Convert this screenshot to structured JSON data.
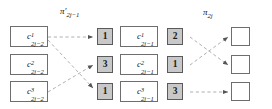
{
  "figure": {
    "title_labels": {
      "left_permutation": "π′",
      "left_permutation_sub": "2j−1",
      "right_permutation": "π",
      "right_permutation_sub": "2j"
    },
    "columns": {
      "col1_label": "input-cells",
      "col2_label": "first-counter-values",
      "col3_label": "intermediate-cells",
      "col4_label": "second-counter-values",
      "col5_label": "output-cells"
    },
    "col1_cells": [
      {
        "base": "c",
        "sup": "1",
        "sub": "2j−2"
      },
      {
        "base": "c",
        "sup": "2",
        "sub": "2j−2"
      },
      {
        "base": "c",
        "sup": "3",
        "sub": "2j−2"
      }
    ],
    "col2_numbers": [
      "1",
      "3",
      "1"
    ],
    "col3_cells": [
      {
        "base": "c",
        "sup": "1",
        "sub": "2j−1"
      },
      {
        "base": "c",
        "sup": "2",
        "sub": "2j−1"
      },
      {
        "base": "c",
        "sup": "3",
        "sub": "2j−1"
      }
    ],
    "col4_numbers": [
      "2",
      "1",
      "3"
    ],
    "col5_cells": [
      "",
      "",
      ""
    ],
    "colors": {
      "number_fill": "#c8c8c8",
      "box_border": "#6e6e6e",
      "wire": "#a8a8a8",
      "wire_dark": "#8a8a8a",
      "background": "#ffffff",
      "text": "#111111"
    },
    "edges_left": [
      {
        "from": 1,
        "to": 1
      },
      {
        "from": 1,
        "to": 3
      },
      {
        "from": 3,
        "to": 2
      }
    ],
    "edges_right": [
      {
        "from": 1,
        "to": 2
      },
      {
        "from": 2,
        "to": 1
      },
      {
        "from": 3,
        "to": 3
      }
    ]
  }
}
